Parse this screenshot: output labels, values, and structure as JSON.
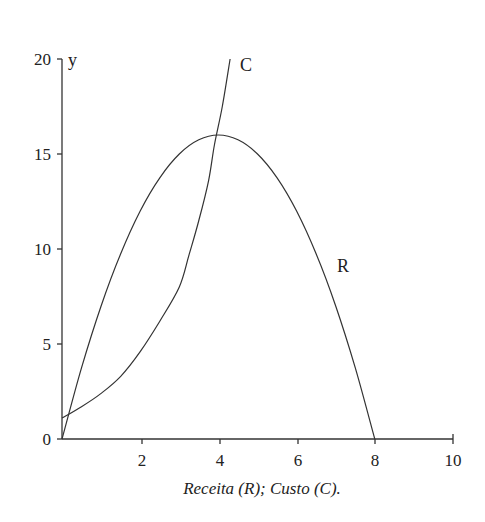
{
  "chart_data": {
    "type": "line",
    "title": "",
    "caption": "Receita (R); Custo (C).",
    "xlabel": "",
    "ylabel": "y",
    "xlim": [
      0,
      10
    ],
    "ylim": [
      0,
      20
    ],
    "x_ticks": [
      2,
      4,
      6,
      8,
      10
    ],
    "y_ticks": [
      0,
      5,
      10,
      15,
      20
    ],
    "grid": false,
    "legend": "inline labels",
    "series": [
      {
        "name": "R",
        "label": "R",
        "description": "Receita, parabola R = 8x - x^2",
        "x": [
          0,
          0.5,
          1,
          1.5,
          2,
          2.5,
          3,
          3.5,
          4,
          4.5,
          5,
          5.5,
          6,
          6.5,
          7,
          7.5,
          8
        ],
        "values": [
          0,
          3.75,
          7,
          9.75,
          12,
          13.75,
          15,
          15.75,
          16,
          15.75,
          15,
          13.75,
          12,
          9.75,
          7,
          3.75,
          0
        ]
      },
      {
        "name": "C",
        "label": "C",
        "description": "Custo, increasing convex curve",
        "x": [
          0,
          0.5,
          1,
          1.5,
          2,
          2.5,
          3,
          3.25,
          3.5,
          3.75,
          3.9,
          4.1,
          4.3
        ],
        "values": [
          1.1,
          1.7,
          2.4,
          3.3,
          4.6,
          6.2,
          8.0,
          9.7,
          11.5,
          13.6,
          15.5,
          17.5,
          20
        ]
      }
    ],
    "annotations": [
      {
        "text": "C",
        "x": 4.5,
        "y": 19.6
      },
      {
        "text": "R",
        "x": 7.1,
        "y": 9.1
      }
    ]
  },
  "labels": {
    "y_axis": "y",
    "curve_c": "C",
    "curve_r": "R",
    "caption": "Receita (R); Custo (C).",
    "x_ticks": [
      "2",
      "4",
      "6",
      "8",
      "10"
    ],
    "y_ticks": [
      "0",
      "5",
      "10",
      "15",
      "20"
    ]
  }
}
